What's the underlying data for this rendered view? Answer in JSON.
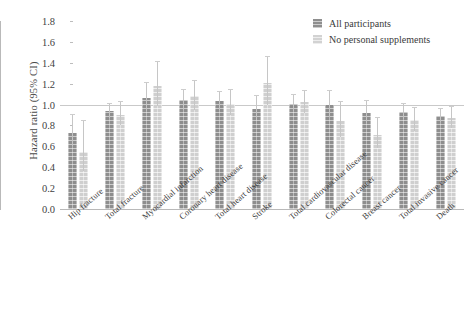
{
  "chart_data": {
    "type": "bar",
    "title": "",
    "subtitle": "",
    "xlabel": "",
    "ylabel": "Hazard ratio (95% CI)",
    "ylim": [
      0.0,
      1.8
    ],
    "yticks": [
      "0.0",
      "0.2",
      "0.4",
      "0.6",
      "0.8",
      "1.0",
      "1.2",
      "1.4",
      "1.6",
      "1.8"
    ],
    "grid": false,
    "reference_line": 1.0,
    "legend_position": "top-right",
    "categories": [
      "Hip fracture",
      "Total fracture",
      "Myocardial infarction",
      "Coronary heart disease",
      "Total heart disease",
      "Stroke",
      "Total cardiovascular disease",
      "Colorectal cancer",
      "Breast cancer",
      "Total invasive cancer",
      "Death"
    ],
    "series": [
      {
        "name": "All participants",
        "color": "#8e8e8e",
        "values": [
          0.73,
          0.94,
          1.06,
          1.04,
          1.03,
          0.96,
          1.01,
          1.0,
          0.92,
          0.93,
          0.89
        ],
        "ci_low": [
          0.6,
          0.87,
          0.94,
          0.95,
          0.95,
          0.85,
          0.94,
          0.88,
          0.82,
          0.86,
          0.83
        ],
        "ci_high": [
          0.9,
          1.01,
          1.21,
          1.14,
          1.12,
          1.08,
          1.09,
          1.13,
          1.03,
          1.01,
          0.96
        ]
      },
      {
        "name": "No personal supplements",
        "color": "#cfcfcf",
        "values": [
          0.55,
          0.9,
          1.18,
          1.08,
          1.01,
          1.21,
          1.02,
          0.84,
          0.71,
          0.85,
          0.87
        ],
        "ci_low": [
          0.36,
          0.8,
          0.99,
          0.95,
          0.9,
          1.0,
          0.92,
          0.69,
          0.58,
          0.75,
          0.78
        ],
        "ci_high": [
          0.84,
          1.02,
          1.41,
          1.23,
          1.14,
          1.46,
          1.13,
          1.02,
          0.87,
          0.97,
          0.98
        ]
      }
    ]
  },
  "legend": {
    "items": [
      {
        "label": "All participants",
        "swatch": "dark"
      },
      {
        "label": "No personal supplements",
        "swatch": "light"
      }
    ]
  },
  "axis": {
    "y_title": "Hazard ratio (95% CI)"
  }
}
